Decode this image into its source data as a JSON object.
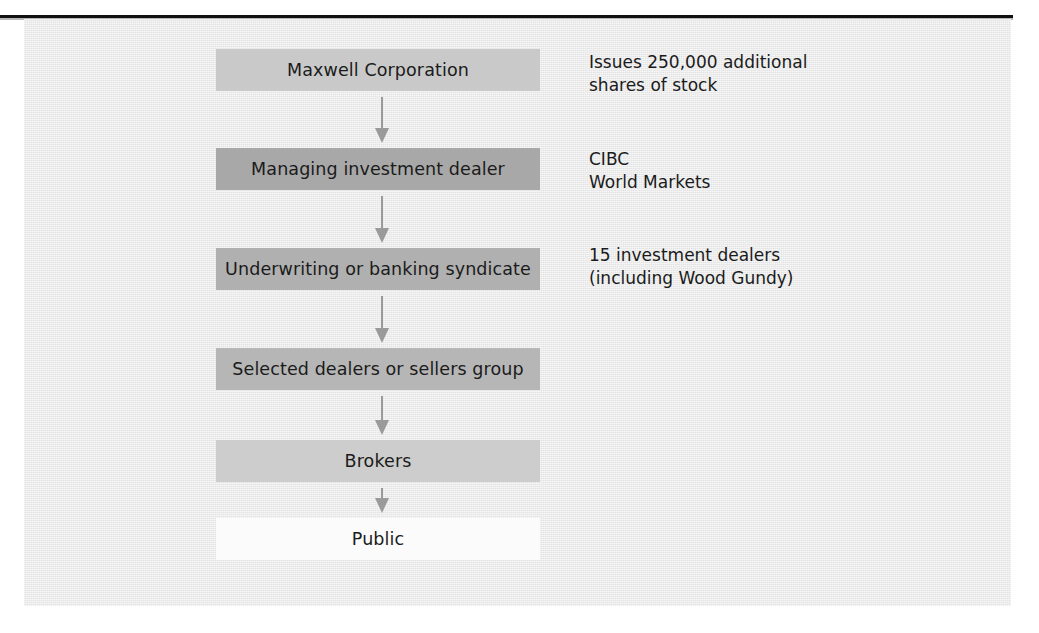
{
  "figure": {
    "background_color": "#ededed",
    "page_color": "#ffffff",
    "rule_color": "#111111",
    "shadow_color": "#b2b2b2",
    "arrow_color": "#9a9a9a",
    "text_color": "#1b1b1b"
  },
  "flow": {
    "boxes": [
      {
        "label": "Maxwell Corporation",
        "fill": "#c9c9c9",
        "top": 49
      },
      {
        "label": "Managing investment dealer",
        "fill": "#a8a8a8",
        "top": 148
      },
      {
        "label": "Underwriting or banking syndicate",
        "fill": "#b0b0b0",
        "top": 248
      },
      {
        "label": "Selected dealers or sellers group",
        "fill": "#b6b6b6",
        "top": 348
      },
      {
        "label": "Brokers",
        "fill": "#cdcdcd",
        "top": 440
      },
      {
        "label": "Public",
        "fill": "#fbfbfb",
        "top": 518
      }
    ],
    "arrows": [
      {
        "top": 97,
        "height": 46
      },
      {
        "top": 196,
        "height": 47
      },
      {
        "top": 296,
        "height": 47
      },
      {
        "top": 396,
        "height": 39
      },
      {
        "top": 488,
        "height": 25
      }
    ]
  },
  "annotations": [
    {
      "name": "issuer-note",
      "text": "Issues 250,000 additional\nshares of stock",
      "top": 51
    },
    {
      "name": "managing-dealer-note",
      "text": "CIBC\nWorld Markets",
      "top": 148
    },
    {
      "name": "syndicate-note",
      "text": "15 investment dealers\n(including Wood Gundy)",
      "top": 244
    }
  ]
}
